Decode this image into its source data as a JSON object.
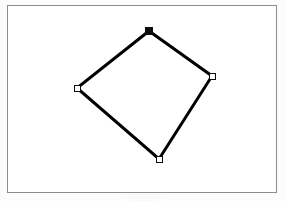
{
  "app": {
    "title": "Shape Editor Canvas",
    "canvas_label": "drawing-canvas"
  },
  "canvas": {
    "width": 285,
    "height": 201,
    "background_color": "#ffffff",
    "frame": {
      "x": 7,
      "y": 5,
      "width": 270,
      "height": 188,
      "border_color": "#8d8d8d",
      "border_width": 1
    }
  },
  "shape": {
    "name": "quadrilateral",
    "type": "closed-polygon",
    "selected": true,
    "stroke_color": "#000000",
    "stroke_width": 3,
    "fill_color": "none",
    "points": [
      {
        "label": "top",
        "x": 149,
        "y": 31
      },
      {
        "label": "right",
        "x": 212,
        "y": 76
      },
      {
        "label": "bottom",
        "x": 159,
        "y": 159
      },
      {
        "label": "left",
        "x": 77,
        "y": 88
      }
    ]
  },
  "handles": [
    {
      "name": "vertex-handle-top",
      "x": 149,
      "y": 31,
      "state": "active",
      "fill": "#0d0d0d",
      "stroke": "#0d0d0d",
      "size": 8
    },
    {
      "name": "vertex-handle-right",
      "x": 212,
      "y": 76,
      "state": "idle",
      "fill": "#ffffff",
      "stroke": "#0d0d0d",
      "size": 7
    },
    {
      "name": "vertex-handle-bottom",
      "x": 159,
      "y": 159,
      "state": "idle",
      "fill": "#ffffff",
      "stroke": "#0d0d0d",
      "size": 7
    },
    {
      "name": "vertex-handle-left",
      "x": 77,
      "y": 88,
      "state": "idle",
      "fill": "#ffffff",
      "stroke": "#0d0d0d",
      "size": 7
    }
  ],
  "colors": {
    "page_background": "#fcfcfc",
    "canvas_background": "#ffffff",
    "stroke": "#000000",
    "frame_border": "#8d8d8d",
    "handle_fill_active": "#0d0d0d",
    "handle_fill_idle": "#ffffff"
  }
}
